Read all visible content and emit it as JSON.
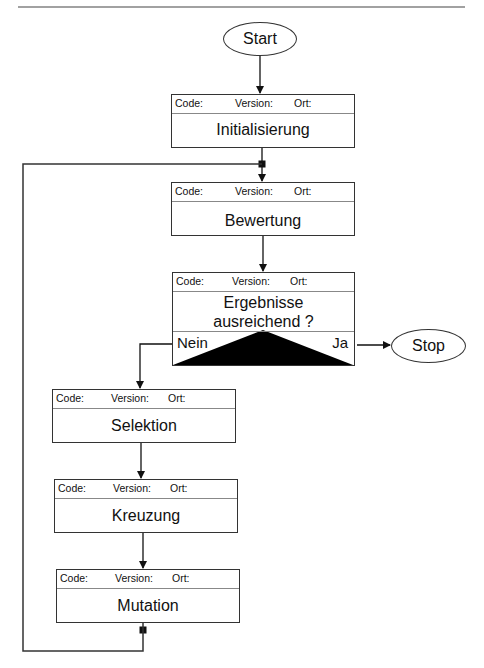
{
  "diagram": {
    "type": "flowchart",
    "title": "",
    "header_fields": {
      "code": "Code:",
      "version": "Version:",
      "location": "Ort:"
    },
    "start": {
      "label": "Start"
    },
    "stop": {
      "label": "Stop"
    },
    "steps": {
      "init": {
        "label": "Initialisierung"
      },
      "eval": {
        "label": "Bewertung"
      },
      "select": {
        "label": "Selektion"
      },
      "cross": {
        "label": "Kreuzung"
      },
      "mutate": {
        "label": "Mutation"
      }
    },
    "decision": {
      "line1": "Ergebnisse",
      "line2": "ausreichend ?",
      "no_label": "Nein",
      "yes_label": "Ja"
    },
    "edges": [
      {
        "from": "Start",
        "to": "Initialisierung"
      },
      {
        "from": "Initialisierung",
        "to": "Bewertung"
      },
      {
        "from": "Bewertung",
        "to": "Ergebnisse ausreichend ?"
      },
      {
        "from": "Ergebnisse ausreichend ?",
        "to": "Stop",
        "label": "Ja"
      },
      {
        "from": "Ergebnisse ausreichend ?",
        "to": "Selektion",
        "label": "Nein"
      },
      {
        "from": "Selektion",
        "to": "Kreuzung"
      },
      {
        "from": "Kreuzung",
        "to": "Mutation"
      },
      {
        "from": "Mutation",
        "to": "Bewertung",
        "label": "loop"
      }
    ]
  }
}
